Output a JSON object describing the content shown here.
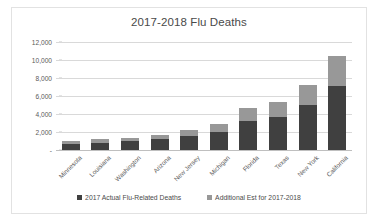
{
  "chart_data": {
    "type": "bar",
    "subtype": "stacked-column",
    "title": "2017-2018 Flu Deaths",
    "xlabel": "",
    "ylabel": "",
    "ylim": [
      0,
      12000
    ],
    "yticks": [
      0,
      2000,
      4000,
      6000,
      8000,
      10000,
      12000
    ],
    "ytick_labels": [
      "-",
      "2,000",
      "4,000",
      "6,000",
      "8,000",
      "10,000",
      "12,000"
    ],
    "grid": true,
    "legend_position": "bottom",
    "categories": [
      "Minnesota",
      "Louisiana",
      "Washington",
      "Arizona",
      "New Jersey",
      "Michigan",
      "Florida",
      "Texas",
      "New York",
      "California"
    ],
    "series": [
      {
        "name": "2017 Actual Flu-Related Deaths",
        "color": "#404040",
        "values": [
          700,
          800,
          950,
          1200,
          1600,
          2000,
          3200,
          3700,
          4950,
          7100
        ]
      },
      {
        "name": "Additional Est for 2017-2018",
        "color": "#989898",
        "values": [
          250,
          400,
          400,
          500,
          600,
          850,
          1500,
          1650,
          2300,
          3400
        ]
      }
    ],
    "totals": [
      950,
      1200,
      1350,
      1700,
      2200,
      2850,
      4700,
      5350,
      7250,
      10500
    ]
  },
  "legend": {
    "items": [
      {
        "label": "2017 Actual Flu-Related Deaths",
        "color": "#404040"
      },
      {
        "label": "Additional Est for 2017-2018",
        "color": "#989898"
      }
    ]
  }
}
